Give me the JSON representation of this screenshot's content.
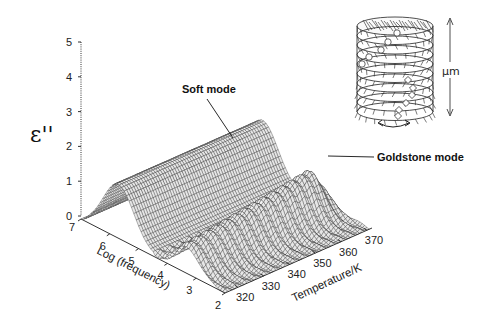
{
  "chart_data": {
    "type": "surface3d",
    "title": "",
    "zlabel": "ε''",
    "xlabel": "Log (frequency)",
    "ylabel": "Temperature/K",
    "z_ticks": [
      "0",
      "1",
      "2",
      "3",
      "4",
      "5"
    ],
    "zlim": [
      0,
      5
    ],
    "x_ticks": [
      "7",
      "6",
      "5",
      "4",
      "3",
      "2"
    ],
    "xlim": [
      2,
      7
    ],
    "y_ticks": [
      "320",
      "330",
      "340",
      "350",
      "360",
      "370"
    ],
    "ylim": [
      315,
      372
    ],
    "annotations": [
      {
        "text": "Soft mode",
        "points_to": "low-frequency ridge (log f ≈ 5.5–6), ε'' ≈ 1.5, constant across temperature"
      },
      {
        "text": "Goldstone mode",
        "points_to": "high-temperature end ridge (log f ≈ 3), ε'' ≈ 1.1"
      }
    ],
    "series": [
      {
        "name": "Soft mode",
        "description": "smooth ridge centered near log f ≈ 5.8",
        "peak_value": 1.5
      },
      {
        "name": "Goldstone mode",
        "description": "broad peak near log f ≈ 3–3.5, rising with temperature, collapses near 370 K",
        "peak_value": 1.2
      }
    ],
    "grid": false
  },
  "figure": {
    "z_axis_label": "ε''",
    "x_axis_title": "Log (frequency)",
    "y_axis_title": "Temperature/K",
    "soft_mode_label": "Soft mode",
    "goldstone_label": "Goldstone mode"
  },
  "inset": {
    "description": "helical smectic C* layer stack (cylinder of layers with tilted molecules)",
    "scale_label": "μm"
  }
}
